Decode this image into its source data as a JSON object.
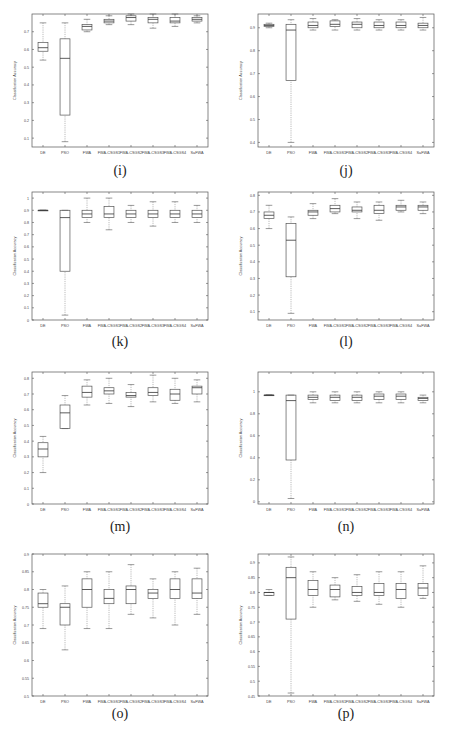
{
  "figure": {
    "captions": [
      "(i)",
      "(j)",
      "(k)",
      "(l)",
      "(m)",
      "(n)",
      "(o)",
      "(p)"
    ]
  },
  "chart_data": [
    {
      "id": "i",
      "type": "box",
      "title": "",
      "caption": "(i)",
      "xlabel": "",
      "ylabel": "Classification Accuracy",
      "categories": [
        "DE",
        "PSO",
        "FWA",
        "FWA-CSGS1",
        "FWA-CSGS2",
        "FWA-CSGS3",
        "FWA-CSGS4",
        "SaFWA"
      ],
      "ylim": [
        0.05,
        0.8
      ],
      "yticks": [
        0.1,
        0.2,
        0.3,
        0.4,
        0.5,
        0.6,
        0.7
      ],
      "grid": false,
      "boxes": [
        {
          "min": 0.54,
          "q1": 0.59,
          "median": 0.61,
          "q3": 0.64,
          "max": 0.75
        },
        {
          "min": 0.08,
          "q1": 0.23,
          "median": 0.55,
          "q3": 0.66,
          "max": 0.75
        },
        {
          "min": 0.7,
          "q1": 0.71,
          "median": 0.73,
          "q3": 0.74,
          "max": 0.77
        },
        {
          "min": 0.74,
          "q1": 0.75,
          "median": 0.76,
          "q3": 0.77,
          "max": 0.79
        },
        {
          "min": 0.74,
          "q1": 0.76,
          "median": 0.78,
          "q3": 0.79,
          "max": 0.8
        },
        {
          "min": 0.72,
          "q1": 0.75,
          "median": 0.77,
          "q3": 0.78,
          "max": 0.8
        },
        {
          "min": 0.73,
          "q1": 0.75,
          "median": 0.76,
          "q3": 0.78,
          "max": 0.8
        },
        {
          "min": 0.75,
          "q1": 0.76,
          "median": 0.77,
          "q3": 0.78,
          "max": 0.79
        }
      ]
    },
    {
      "id": "j",
      "type": "box",
      "title": "",
      "caption": "(j)",
      "xlabel": "",
      "ylabel": "Classification Accuracy",
      "categories": [
        "DE",
        "PSO",
        "FWA",
        "FWA-CSGS1",
        "FWA-CSGS2",
        "FWA-CSGS3",
        "FWA-CSGS4",
        "SaFWA"
      ],
      "ylim": [
        0.38,
        0.96
      ],
      "yticks": [
        0.4,
        0.5,
        0.6,
        0.7,
        0.8,
        0.9
      ],
      "grid": false,
      "boxes": [
        {
          "min": 0.9,
          "q1": 0.905,
          "median": 0.91,
          "q3": 0.915,
          "max": 0.92
        },
        {
          "min": 0.4,
          "q1": 0.67,
          "median": 0.89,
          "q3": 0.915,
          "max": 0.935
        },
        {
          "min": 0.89,
          "q1": 0.9,
          "median": 0.91,
          "q3": 0.925,
          "max": 0.94
        },
        {
          "min": 0.89,
          "q1": 0.905,
          "median": 0.915,
          "q3": 0.93,
          "max": 0.935
        },
        {
          "min": 0.89,
          "q1": 0.9,
          "median": 0.915,
          "q3": 0.925,
          "max": 0.94
        },
        {
          "min": 0.89,
          "q1": 0.9,
          "median": 0.91,
          "q3": 0.925,
          "max": 0.935
        },
        {
          "min": 0.89,
          "q1": 0.9,
          "median": 0.91,
          "q3": 0.925,
          "max": 0.935
        },
        {
          "min": 0.89,
          "q1": 0.9,
          "median": 0.91,
          "q3": 0.92,
          "max": 0.945
        }
      ]
    },
    {
      "id": "k",
      "type": "box",
      "title": "",
      "caption": "(k)",
      "xlabel": "",
      "ylabel": "Classification Accuracy",
      "categories": [
        "DE",
        "PSO",
        "FWA",
        "FWA-CSGS1",
        "FWA-CSGS2",
        "FWA-CSGS3",
        "FWA-CSGS4",
        "SaFWA"
      ],
      "ylim": [
        0,
        1.05
      ],
      "yticks": [
        0,
        0.1,
        0.2,
        0.3,
        0.4,
        0.5,
        0.6,
        0.7,
        0.8,
        0.9,
        1
      ],
      "grid": false,
      "boxes": [
        {
          "min": 0.9,
          "q1": 0.9,
          "median": 0.9,
          "q3": 0.9,
          "max": 0.9
        },
        {
          "min": 0.04,
          "q1": 0.4,
          "median": 0.84,
          "q3": 0.9,
          "max": 0.9
        },
        {
          "min": 0.8,
          "q1": 0.84,
          "median": 0.87,
          "q3": 0.9,
          "max": 1.0
        },
        {
          "min": 0.74,
          "q1": 0.84,
          "median": 0.87,
          "q3": 0.93,
          "max": 1.0
        },
        {
          "min": 0.8,
          "q1": 0.84,
          "median": 0.87,
          "q3": 0.9,
          "max": 0.94
        },
        {
          "min": 0.77,
          "q1": 0.84,
          "median": 0.87,
          "q3": 0.9,
          "max": 0.97
        },
        {
          "min": 0.8,
          "q1": 0.84,
          "median": 0.87,
          "q3": 0.9,
          "max": 0.97
        },
        {
          "min": 0.8,
          "q1": 0.84,
          "median": 0.87,
          "q3": 0.9,
          "max": 0.94
        }
      ]
    },
    {
      "id": "l",
      "type": "box",
      "title": "",
      "caption": "(l)",
      "xlabel": "",
      "ylabel": "Classification Accuracy",
      "categories": [
        "DE",
        "PSO",
        "FWA",
        "FWA-CSGS1",
        "FWA-CSGS2",
        "FWA-CSGS3",
        "FWA-CSGS4",
        "SaFWA"
      ],
      "ylim": [
        0.05,
        0.82
      ],
      "yticks": [
        0.1,
        0.2,
        0.3,
        0.4,
        0.5,
        0.6,
        0.7,
        0.8
      ],
      "grid": false,
      "boxes": [
        {
          "min": 0.6,
          "q1": 0.66,
          "median": 0.68,
          "q3": 0.7,
          "max": 0.74
        },
        {
          "min": 0.09,
          "q1": 0.31,
          "median": 0.53,
          "q3": 0.63,
          "max": 0.67
        },
        {
          "min": 0.66,
          "q1": 0.68,
          "median": 0.7,
          "q3": 0.71,
          "max": 0.75
        },
        {
          "min": 0.69,
          "q1": 0.7,
          "median": 0.72,
          "q3": 0.74,
          "max": 0.78
        },
        {
          "min": 0.66,
          "q1": 0.7,
          "median": 0.71,
          "q3": 0.73,
          "max": 0.76
        },
        {
          "min": 0.65,
          "q1": 0.69,
          "median": 0.71,
          "q3": 0.74,
          "max": 0.76
        },
        {
          "min": 0.7,
          "q1": 0.71,
          "median": 0.73,
          "q3": 0.74,
          "max": 0.77
        },
        {
          "min": 0.69,
          "q1": 0.71,
          "median": 0.73,
          "q3": 0.74,
          "max": 0.76
        }
      ]
    },
    {
      "id": "m",
      "type": "box",
      "title": "",
      "caption": "(m)",
      "xlabel": "",
      "ylabel": "Classification Accuracy",
      "categories": [
        "DE",
        "PSO",
        "FWA",
        "FWA-CSGS1",
        "FWA-CSGS2",
        "FWA-CSGS3",
        "FWA-CSGS4",
        "SaFWA"
      ],
      "ylim": [
        0,
        0.84
      ],
      "yticks": [
        0,
        0.1,
        0.2,
        0.3,
        0.4,
        0.5,
        0.6,
        0.7,
        0.8
      ],
      "grid": false,
      "boxes": [
        {
          "min": 0.2,
          "q1": 0.3,
          "median": 0.35,
          "q3": 0.39,
          "max": 0.43
        },
        {
          "min": 0.48,
          "q1": 0.48,
          "median": 0.58,
          "q3": 0.63,
          "max": 0.69
        },
        {
          "min": 0.63,
          "q1": 0.68,
          "median": 0.71,
          "q3": 0.75,
          "max": 0.79
        },
        {
          "min": 0.64,
          "q1": 0.7,
          "median": 0.72,
          "q3": 0.74,
          "max": 0.8
        },
        {
          "min": 0.62,
          "q1": 0.68,
          "median": 0.69,
          "q3": 0.71,
          "max": 0.76
        },
        {
          "min": 0.65,
          "q1": 0.69,
          "median": 0.71,
          "q3": 0.74,
          "max": 0.82
        },
        {
          "min": 0.64,
          "q1": 0.66,
          "median": 0.7,
          "q3": 0.73,
          "max": 0.8
        },
        {
          "min": 0.65,
          "q1": 0.7,
          "median": 0.74,
          "q3": 0.75,
          "max": 0.79
        }
      ]
    },
    {
      "id": "n",
      "type": "box",
      "title": "",
      "caption": "(n)",
      "xlabel": "",
      "ylabel": "Classification Accuracy",
      "categories": [
        "DE",
        "PSO",
        "FWA",
        "FWA-CSGS1",
        "FWA-CSGS2",
        "FWA-CSGS3",
        "FWA-CSGS4",
        "SaFWA"
      ],
      "ylim": [
        -0.02,
        1.18
      ],
      "yticks": [
        0,
        0.2,
        0.4,
        0.6,
        0.8,
        1
      ],
      "grid": false,
      "boxes": [
        {
          "min": 0.97,
          "q1": 0.97,
          "median": 0.97,
          "q3": 0.97,
          "max": 0.97
        },
        {
          "min": 0.03,
          "q1": 0.38,
          "median": 0.92,
          "q3": 0.97,
          "max": 0.97
        },
        {
          "min": 0.9,
          "q1": 0.93,
          "median": 0.95,
          "q3": 0.97,
          "max": 1.0
        },
        {
          "min": 0.9,
          "q1": 0.92,
          "median": 0.95,
          "q3": 0.97,
          "max": 1.0
        },
        {
          "min": 0.9,
          "q1": 0.92,
          "median": 0.95,
          "q3": 0.97,
          "max": 1.0
        },
        {
          "min": 0.9,
          "q1": 0.93,
          "median": 0.96,
          "q3": 0.98,
          "max": 1.0
        },
        {
          "min": 0.9,
          "q1": 0.93,
          "median": 0.96,
          "q3": 0.98,
          "max": 1.0
        },
        {
          "min": 0.9,
          "q1": 0.92,
          "median": 0.94,
          "q3": 0.95,
          "max": 0.97
        }
      ]
    },
    {
      "id": "o",
      "type": "box",
      "title": "",
      "caption": "(o)",
      "xlabel": "",
      "ylabel": "Classification Accuracy",
      "categories": [
        "DE",
        "PSO",
        "FWA",
        "FWA-CSGS1",
        "FWA-CSGS2",
        "FWA-CSGS3",
        "FWA-CSGS4",
        "SaFWA"
      ],
      "ylim": [
        0.5,
        0.9
      ],
      "yticks": [
        0.5,
        0.55,
        0.6,
        0.65,
        0.7,
        0.75,
        0.8,
        0.85,
        0.9
      ],
      "grid": false,
      "boxes": [
        {
          "min": 0.69,
          "q1": 0.75,
          "median": 0.76,
          "q3": 0.79,
          "max": 0.8
        },
        {
          "min": 0.63,
          "q1": 0.7,
          "median": 0.75,
          "q3": 0.76,
          "max": 0.81
        },
        {
          "min": 0.69,
          "q1": 0.75,
          "median": 0.8,
          "q3": 0.83,
          "max": 0.85
        },
        {
          "min": 0.69,
          "q1": 0.76,
          "median": 0.775,
          "q3": 0.8,
          "max": 0.85
        },
        {
          "min": 0.73,
          "q1": 0.76,
          "median": 0.8,
          "q3": 0.81,
          "max": 0.87
        },
        {
          "min": 0.72,
          "q1": 0.775,
          "median": 0.79,
          "q3": 0.8,
          "max": 0.83
        },
        {
          "min": 0.7,
          "q1": 0.775,
          "median": 0.8,
          "q3": 0.83,
          "max": 0.85
        },
        {
          "min": 0.73,
          "q1": 0.775,
          "median": 0.79,
          "q3": 0.83,
          "max": 0.86
        }
      ]
    },
    {
      "id": "p",
      "type": "box",
      "title": "",
      "caption": "(p)",
      "xlabel": "",
      "ylabel": "Classification Accuracy",
      "categories": [
        "DE",
        "PSO",
        "FWA",
        "FWA-CSGS1",
        "FWA-CSGS2",
        "FWA-CSGS3",
        "FWA-CSGS4",
        "SaFWA"
      ],
      "ylim": [
        0.45,
        0.93
      ],
      "yticks": [
        0.45,
        0.5,
        0.55,
        0.6,
        0.65,
        0.7,
        0.75,
        0.8,
        0.85,
        0.9
      ],
      "grid": false,
      "boxes": [
        {
          "min": 0.79,
          "q1": 0.79,
          "median": 0.8,
          "q3": 0.8,
          "max": 0.81
        },
        {
          "min": 0.46,
          "q1": 0.71,
          "median": 0.85,
          "q3": 0.885,
          "max": 0.92
        },
        {
          "min": 0.75,
          "q1": 0.79,
          "median": 0.81,
          "q3": 0.84,
          "max": 0.87
        },
        {
          "min": 0.775,
          "q1": 0.785,
          "median": 0.81,
          "q3": 0.825,
          "max": 0.85
        },
        {
          "min": 0.77,
          "q1": 0.79,
          "median": 0.8,
          "q3": 0.82,
          "max": 0.86
        },
        {
          "min": 0.76,
          "q1": 0.79,
          "median": 0.8,
          "q3": 0.83,
          "max": 0.87
        },
        {
          "min": 0.75,
          "q1": 0.78,
          "median": 0.81,
          "q3": 0.83,
          "max": 0.87
        },
        {
          "min": 0.78,
          "q1": 0.79,
          "median": 0.815,
          "q3": 0.83,
          "max": 0.89
        }
      ]
    }
  ]
}
